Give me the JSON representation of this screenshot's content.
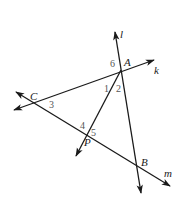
{
  "diagram": {
    "type": "geometry",
    "colors": {
      "line": "#1a1a1a",
      "angle_label": "#555555",
      "background": "#ffffff"
    },
    "points": [
      {
        "name": "A",
        "x": 121,
        "y": 70
      },
      {
        "name": "B",
        "x": 137,
        "y": 167
      },
      {
        "name": "C",
        "x": 35,
        "y": 102
      },
      {
        "name": "P",
        "x": 87,
        "y": 135
      }
    ],
    "lines": [
      {
        "name": "l",
        "label": "l",
        "from": [
          115,
          32
        ],
        "to": [
          141,
          193
        ],
        "through": [
          "A",
          "B"
        ]
      },
      {
        "name": "k",
        "label": "k",
        "from": [
          14,
          110
        ],
        "to": [
          154,
          60
        ],
        "through": [
          "C",
          "A"
        ]
      },
      {
        "name": "m",
        "label": "m",
        "from": [
          16,
          92
        ],
        "to": [
          170,
          186
        ],
        "through": [
          "C",
          "P",
          "B"
        ]
      },
      {
        "name": "AP",
        "label": "",
        "from": [
          121,
          70
        ],
        "to": [
          76,
          156
        ],
        "through": [
          "A",
          "P"
        ]
      }
    ],
    "point_labels": {
      "A": "A",
      "B": "B",
      "C": "C",
      "P": "P"
    },
    "line_labels": {
      "l": "l",
      "k": "k",
      "m": "m"
    },
    "angle_labels": {
      "a1": "1",
      "a2": "2",
      "a3": "3",
      "a4": "4",
      "a5": "5",
      "a6": "6"
    }
  }
}
